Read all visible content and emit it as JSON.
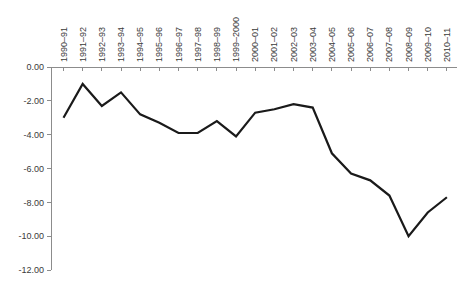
{
  "chart_data": {
    "type": "line",
    "title": "",
    "xlabel": "",
    "ylabel": "",
    "categories": [
      "1990–91",
      "1991–92",
      "1992–93",
      "1993–94",
      "1994–95",
      "1995–96",
      "1996–97",
      "1997–98",
      "1998–99",
      "1999–2000",
      "2000–01",
      "2001–02",
      "2002–03",
      "2003–04",
      "2004–05",
      "2005–06",
      "2006–07",
      "2007–08",
      "2008–09",
      "2009–10",
      "2010–11"
    ],
    "values": [
      -3.0,
      -1.0,
      -2.3,
      -1.5,
      -2.8,
      -3.3,
      -3.9,
      -3.9,
      -3.2,
      -4.1,
      -2.7,
      -2.5,
      -2.2,
      -2.4,
      -5.1,
      -6.3,
      -6.7,
      -7.6,
      -10.0,
      -8.6,
      -7.7
    ],
    "y_ticks": [
      "0.00",
      "-2.00",
      "-4.00",
      "-6.00",
      "-8.00",
      "-10.00",
      "-12.00"
    ],
    "ylim": [
      -12,
      0
    ],
    "grid": false,
    "legend": "none",
    "line_color": "#1a1a1a",
    "axis_color": "#8c8c8c",
    "tick_label_color": "#3a3a3a"
  }
}
